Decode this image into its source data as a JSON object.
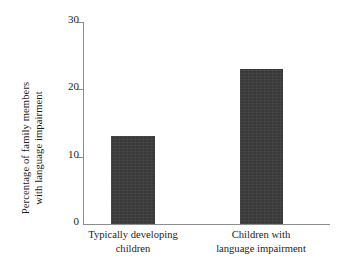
{
  "chart_data": {
    "type": "bar",
    "title": "",
    "xlabel": "",
    "ylabel": "Percentage of family members with language impairment",
    "ylabel_lines": [
      "Percentage of family members",
      "with language impairment"
    ],
    "categories": [
      "Typically developing children",
      "Children with language impairment"
    ],
    "category_lines": [
      [
        "Typically developing",
        "children"
      ],
      [
        "Children with",
        "language impairment"
      ]
    ],
    "values": [
      13,
      23
    ],
    "ylim": [
      0,
      30
    ],
    "yticks": [
      0,
      10,
      20,
      30
    ],
    "ytick_labels": [
      "0",
      "10",
      "20",
      "30"
    ],
    "grid": false,
    "legend": false,
    "bar_color": "#3a3a3a",
    "axis_color": "#8d8d8d",
    "background_color": "#ffffff"
  }
}
